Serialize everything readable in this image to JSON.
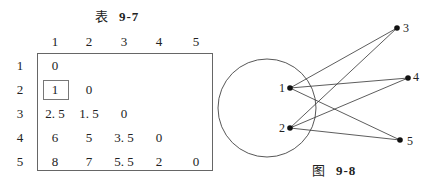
{
  "table": {
    "caption_prefix": "表",
    "caption_number": "9-7",
    "column_headers": [
      "1",
      "2",
      "3",
      "4",
      "5"
    ],
    "row_headers": [
      "1",
      "2",
      "3",
      "4",
      "5"
    ],
    "rows": [
      [
        "0",
        "",
        "",
        "",
        ""
      ],
      [
        "1",
        "0",
        "",
        "",
        ""
      ],
      [
        "2. 5",
        "1. 5",
        "0",
        "",
        ""
      ],
      [
        "6",
        "5",
        "3. 5",
        "0",
        ""
      ],
      [
        "8",
        "7",
        "5. 5",
        "2",
        "0"
      ]
    ],
    "highlighted_cell": {
      "row": 2,
      "col": 1,
      "value": "1"
    }
  },
  "figure": {
    "caption_prefix": "图",
    "caption_number": "9-8",
    "nodes": [
      {
        "id": "1",
        "x": 290,
        "y": 88
      },
      {
        "id": "2",
        "x": 290,
        "y": 128
      },
      {
        "id": "3",
        "x": 397,
        "y": 28
      },
      {
        "id": "4",
        "x": 408,
        "y": 78
      },
      {
        "id": "5",
        "x": 400,
        "y": 140
      }
    ],
    "edges": [
      [
        "1",
        "3"
      ],
      [
        "1",
        "4"
      ],
      [
        "1",
        "5"
      ],
      [
        "2",
        "3"
      ],
      [
        "2",
        "4"
      ],
      [
        "2",
        "5"
      ]
    ],
    "cluster_circle": {
      "cx": 267,
      "cy": 108,
      "r": 49,
      "contains": [
        "1",
        "2"
      ]
    }
  }
}
